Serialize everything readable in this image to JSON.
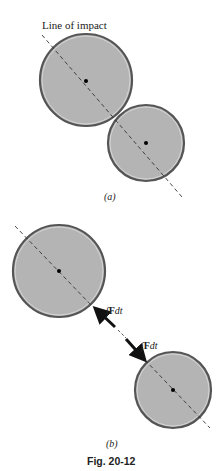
{
  "figure": {
    "line_label": "Line of impact",
    "panel_a_label": "(a)",
    "panel_b_label": "(b)",
    "impulse_label_1": "∫Fdt",
    "impulse_label_2": "∫Fdt",
    "caption": "Fig. 20-12",
    "colors": {
      "ball_fill": "#b4b4b4",
      "ball_edge": "#555555",
      "line": "#333333",
      "arrow": "#111111"
    }
  }
}
